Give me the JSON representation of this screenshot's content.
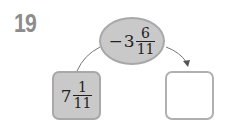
{
  "problem": {
    "number": "19",
    "ellipse": {
      "sign": "−",
      "whole": "3",
      "numerator": "6",
      "denominator": "11"
    },
    "left_box": {
      "sign": "",
      "whole": "7",
      "numerator": "1",
      "denominator": "11"
    },
    "right_box": {
      "value": ""
    }
  },
  "colors": {
    "shape_fill": "#c9c9c9",
    "shape_border": "#a8a8a8",
    "number_color": "#8c8c8c",
    "line_color": "#777777"
  }
}
